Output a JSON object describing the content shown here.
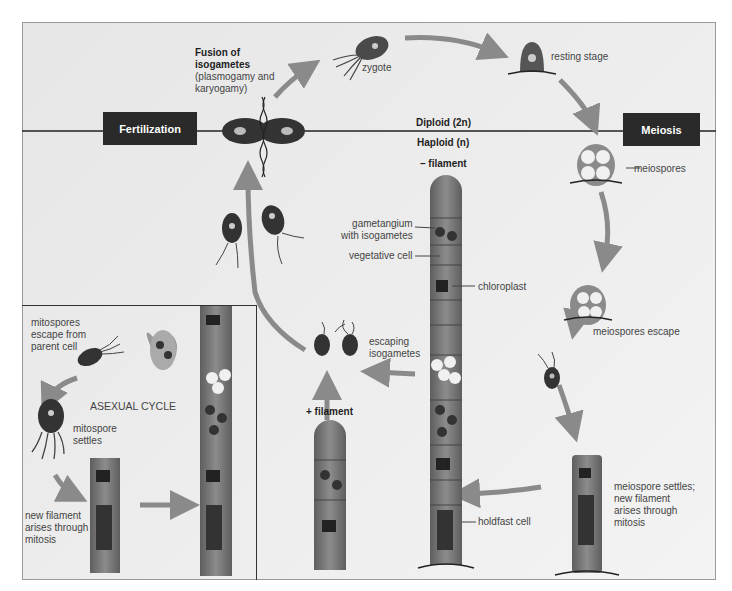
{
  "diagram": {
    "boxes": {
      "fertilization": "Fertilization",
      "meiosis": "Meiosis"
    },
    "ploidy": {
      "diploid": "Diploid (2n)",
      "haploid": "Haploid (n)"
    },
    "labels": {
      "fusion_title_1": "Fusion of",
      "fusion_title_2": "isogametes",
      "fusion_sub_1": "(plasmogamy and",
      "fusion_sub_2": "karyogamy)",
      "zygote": "zygote",
      "resting_stage": "resting stage",
      "meiospores": "meiospores",
      "meiospores_escape": "meiospores escape",
      "meiospore_settles_1": "meiospore settles;",
      "meiospore_settles_2": "new filament",
      "meiospore_settles_3": "arises through",
      "meiospore_settles_4": "mitosis",
      "minus_filament": "– filament",
      "plus_filament": "+ filament",
      "gametangium_1": "gametangium",
      "gametangium_2": "with isogametes",
      "vegetative_cell": "vegetative cell",
      "chloroplast": "chloroplast",
      "escaping_1": "escaping",
      "escaping_2": "isogametes",
      "holdfast_cell": "holdfast cell"
    },
    "asexual": {
      "title": "ASEXUAL CYCLE",
      "mitospores_escape_1": "mitospores",
      "mitospores_escape_2": "escape from",
      "mitospores_escape_3": "parent cell",
      "mitospore_settles_1": "mitospore",
      "mitospore_settles_2": "settles",
      "new_filament_1": "new filament",
      "new_filament_2": "arises through",
      "new_filament_3": "mitosis"
    },
    "colors": {
      "background": "#ebebeb",
      "box_fill": "#2a2a2a",
      "arrow": "#8a8a8a",
      "cell_dark": "#3a3a3a",
      "cell_mid": "#7a7a7a"
    }
  }
}
